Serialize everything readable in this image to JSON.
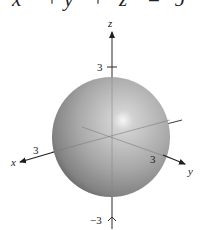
{
  "equation": {
    "text": "x² + y² + z² = 9",
    "parts": [
      "x",
      "+",
      "y",
      "+",
      "z",
      "=",
      "9"
    ]
  },
  "figure": {
    "type": "sphere",
    "radius": 3,
    "axes": {
      "x": {
        "label": "x",
        "tick_label": "3"
      },
      "y": {
        "label": "y",
        "tick_label": "3"
      },
      "z": {
        "label": "z",
        "tick_top": "3",
        "tick_bottom": "−3"
      }
    },
    "colors": {
      "sphere_light": "#f4f4f4",
      "sphere_mid": "#a9a9a9",
      "sphere_dark": "#5e5e5e",
      "axis": "#2a2a2a"
    }
  }
}
